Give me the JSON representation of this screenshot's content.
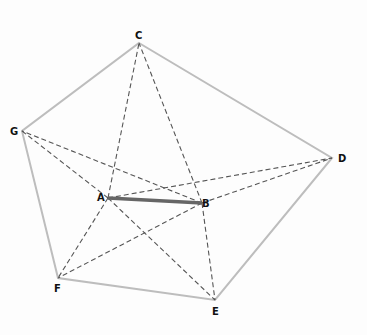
{
  "diagram": {
    "type": "geometry",
    "points": {
      "A": {
        "x": 108,
        "y": 198,
        "label": "A"
      },
      "B": {
        "x": 202,
        "y": 203,
        "label": "B"
      },
      "C": {
        "x": 139,
        "y": 43,
        "label": "C"
      },
      "D": {
        "x": 332,
        "y": 158,
        "label": "D"
      },
      "E": {
        "x": 215,
        "y": 300,
        "label": "E"
      },
      "F": {
        "x": 58,
        "y": 278,
        "label": "F"
      },
      "G": {
        "x": 22,
        "y": 131,
        "label": "G"
      }
    },
    "polygon": [
      "C",
      "D",
      "E",
      "F",
      "G"
    ],
    "solid_segment": [
      "A",
      "B"
    ],
    "dashed_segments": [
      [
        "A",
        "C"
      ],
      [
        "A",
        "D"
      ],
      [
        "A",
        "E"
      ],
      [
        "A",
        "F"
      ],
      [
        "A",
        "G"
      ],
      [
        "B",
        "C"
      ],
      [
        "B",
        "D"
      ],
      [
        "B",
        "E"
      ],
      [
        "B",
        "F"
      ],
      [
        "B",
        "G"
      ]
    ],
    "colors": {
      "polygon": "#bdbdbd",
      "solid": "#666666",
      "dashed": "#555555",
      "label": "#111111"
    }
  }
}
